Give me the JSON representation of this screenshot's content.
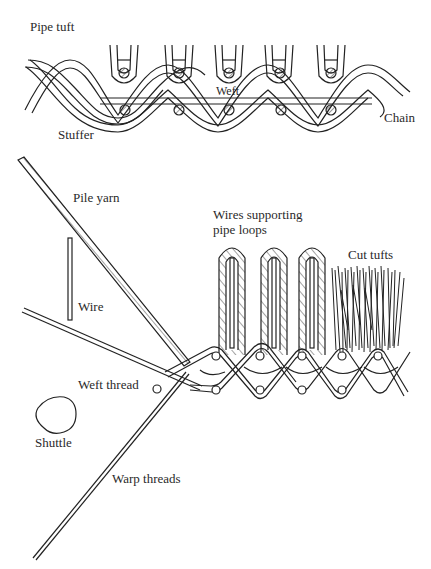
{
  "figure": {
    "top_diagram": {
      "title": "Pipe tuft",
      "labels": {
        "stuffer": "Stuffer",
        "weft": "Weft",
        "chain": "Chain"
      }
    },
    "bottom_diagram": {
      "labels": {
        "pile_yarn": "Pile yarn",
        "wire": "Wire",
        "wires_supporting_line1": "Wires supporting",
        "wires_supporting_line2": "pipe loops",
        "cut_tufts": "Cut tufts",
        "weft_thread": "Weft thread",
        "shuttle": "Shuttle",
        "warp_threads": "Warp threads"
      }
    }
  }
}
